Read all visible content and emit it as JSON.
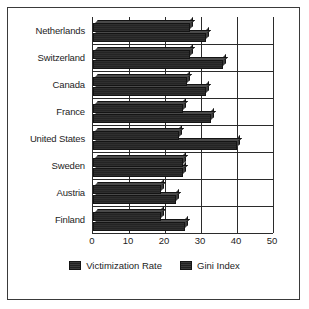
{
  "frame": {
    "border_color": "#3a3a3a",
    "background": "#ffffff"
  },
  "chart_data": {
    "type": "bar",
    "orientation": "horizontal",
    "title": "",
    "xlabel": "",
    "ylabel": "",
    "xlim": [
      0,
      50
    ],
    "xticks": [
      0,
      10,
      20,
      30,
      40,
      50
    ],
    "xtick_labels": [
      "0",
      "10",
      "20",
      "30",
      "40",
      "50"
    ],
    "grid": "vertical",
    "legend_position": "bottom",
    "categories": [
      "Netherlands",
      "Switzerland",
      "Canada",
      "France",
      "United States",
      "Sweden",
      "Austria",
      "Finland"
    ],
    "series": [
      {
        "name": "Victimization Rate",
        "color": "#2a2a2a",
        "values": [
          27,
          27,
          26,
          25,
          24,
          25,
          19,
          19
        ],
        "labels": [
          "27",
          "27",
          "26",
          "25",
          "24",
          "25",
          "19",
          "19"
        ]
      },
      {
        "name": "Gini Index",
        "color": "#202020",
        "values": [
          31.5,
          36.1,
          31.5,
          32.7,
          40.1,
          25,
          23.1,
          25.6
        ],
        "labels": [
          "31.5",
          "36.1",
          "31.5",
          "32.7",
          "40.1",
          "25",
          "23.1",
          "25.6"
        ]
      }
    ]
  },
  "legend": {
    "items": [
      {
        "label": "Victimization Rate",
        "swatch": "legend-swatch-victimization"
      },
      {
        "label": "Gini Index",
        "swatch": "legend-swatch-gini"
      }
    ]
  }
}
